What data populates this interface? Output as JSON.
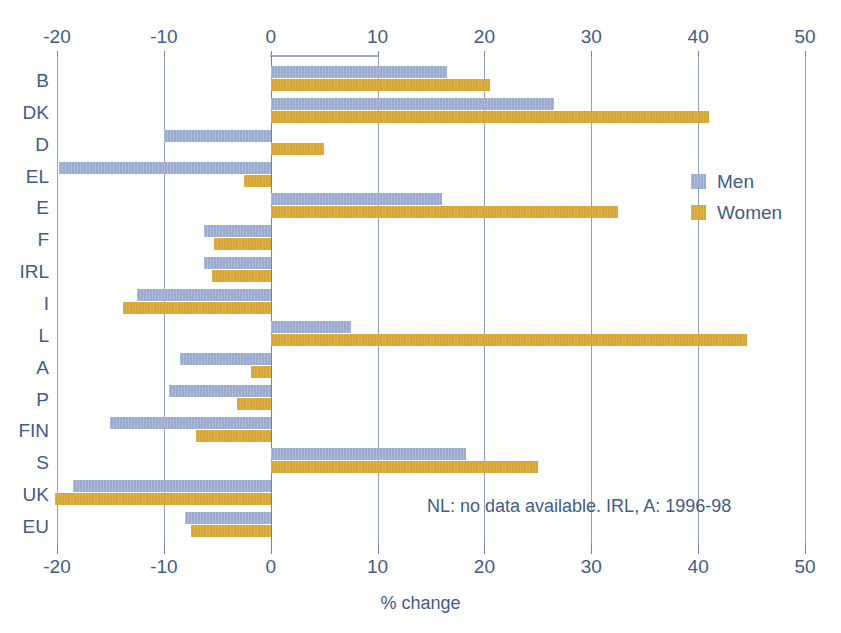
{
  "chart": {
    "xlabel": "% change",
    "note": "NL: no data available. IRL, A: 1996-98",
    "legend": [
      {
        "key": "men",
        "label": "Men",
        "color": "#9aabcf"
      },
      {
        "key": "women",
        "label": "Women",
        "color": "#d7a635"
      }
    ]
  },
  "chart_data": {
    "type": "bar",
    "orientation": "horizontal",
    "title": "",
    "xlabel": "% change",
    "ylabel": "",
    "xlim": [
      -20,
      50
    ],
    "ticks": [
      -20,
      -10,
      0,
      10,
      20,
      30,
      40,
      50
    ],
    "tick_labels": [
      "-20",
      "-10",
      "0",
      "10",
      "20",
      "30",
      "40",
      "50"
    ],
    "grid": true,
    "axis_top": true,
    "axis_bottom": true,
    "legend_position": "right",
    "annotations": [
      "NL: no data available. IRL, A: 1996-98"
    ],
    "categories": [
      "B",
      "DK",
      "D",
      "EL",
      "E",
      "F",
      "IRL",
      "I",
      "L",
      "A",
      "P",
      "FIN",
      "S",
      "UK",
      "EU"
    ],
    "series": [
      {
        "name": "Men",
        "color": "#9aabcf",
        "values": [
          16.5,
          26.5,
          -10.0,
          -19.8,
          16.0,
          -6.2,
          -6.2,
          -12.5,
          7.5,
          -8.5,
          -9.5,
          -15.0,
          18.3,
          -18.5,
          -8.0
        ]
      },
      {
        "name": "Women",
        "color": "#d7a635",
        "values": [
          20.5,
          41.0,
          5.0,
          -2.5,
          32.5,
          -5.3,
          -5.5,
          -13.8,
          44.6,
          -1.8,
          -3.2,
          -7.0,
          25.0,
          -20.2,
          -7.5
        ]
      }
    ]
  }
}
